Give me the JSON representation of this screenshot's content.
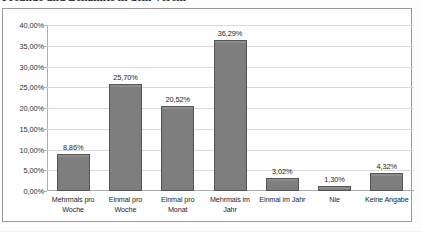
{
  "document": {
    "title": "Freunde und Bekannte in dem Verein"
  },
  "chart_data": {
    "type": "bar",
    "title": "Freunde und Bekannte in dem Verein",
    "xlabel": "",
    "ylabel": "",
    "ylim": [
      0,
      40
    ],
    "grid": true,
    "legend": "none",
    "categories": [
      "Mehrmals pro Woche",
      "Einmal pro Woche",
      "Einmal pro Monat",
      "Mehrmals im Jahr",
      "Einmal im Jahr",
      "Nie",
      "Keine Angabe"
    ],
    "values": [
      8.86,
      25.7,
      20.52,
      36.29,
      3.02,
      1.3,
      4.32
    ],
    "value_labels": [
      "8,86%",
      "25,70%",
      "20,52%",
      "36,29%",
      "3,02%",
      "1,30%",
      "4,32%"
    ],
    "ytick_labels": [
      "0,00%",
      "5,00%",
      "10,00%",
      "15,00%",
      "20,00%",
      "25,00%",
      "30,00%",
      "35,00%",
      "40,00%"
    ],
    "ytick_values": [
      0,
      5,
      10,
      15,
      20,
      25,
      30,
      35,
      40
    ],
    "category_lines": [
      [
        "Mehrmals pro",
        "Woche"
      ],
      [
        "Einmal pro",
        "Woche"
      ],
      [
        "Einmal pro",
        "Monat"
      ],
      [
        "Mehrmals im",
        "Jahr"
      ],
      [
        "Einmal im Jahr",
        ""
      ],
      [
        "Nie",
        ""
      ],
      [
        "Keine Angabe",
        ""
      ]
    ],
    "colors": {
      "bar_fill": "#7e7e7e",
      "bar_border": "#545454",
      "grid": "#d8d8d8",
      "axis": "#a8a8a8",
      "text": "#232323",
      "frame": "#9a9a9a",
      "background": "#ffffff"
    }
  }
}
